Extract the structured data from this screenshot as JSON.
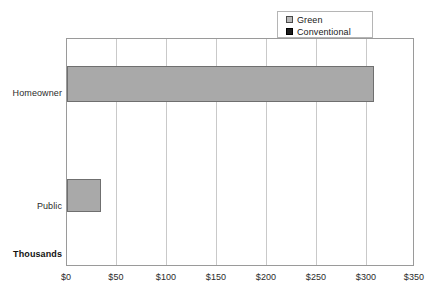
{
  "chart_data": {
    "type": "bar",
    "orientation": "horizontal",
    "title": "",
    "xlabel": "",
    "ylabel": "",
    "units_note": "Thousands",
    "categories": [
      "Homeowner",
      "Public"
    ],
    "series": [
      {
        "name": "Green",
        "color": "#a9a9a9",
        "values": [
          311,
          34
        ]
      },
      {
        "name": "Conventional",
        "color": "#1c1c1c",
        "values": [
          0,
          0
        ]
      }
    ],
    "xlim": [
      0,
      350
    ],
    "xticks": [
      0,
      50,
      100,
      150,
      200,
      250,
      300,
      350
    ],
    "xtick_labels": [
      "$0",
      "$50",
      "$100",
      "$150",
      "$200",
      "$250",
      "$300",
      "$350"
    ],
    "grid": true,
    "grid_axis": "x",
    "legend_position": "top-right",
    "legend_entries": [
      "Green",
      "Conventional"
    ]
  },
  "legend": {
    "entries": [
      {
        "label": "Green",
        "swatch": "green-swatch"
      },
      {
        "label": "Conventional",
        "swatch": "conventional-swatch"
      }
    ]
  },
  "axes": {
    "units_label": "Thousands",
    "y_categories": [
      "Homeowner",
      "Public"
    ],
    "x_labels": [
      "$0",
      "$50",
      "$100",
      "$150",
      "$200",
      "$250",
      "$300",
      "$350"
    ]
  },
  "colors": {
    "green_series": "#a9a9a9",
    "conventional_series": "#1c1c1c",
    "gridline": "#c9c9c9",
    "axis_border": "#9a9a9a",
    "text": "#2b2b2b"
  }
}
